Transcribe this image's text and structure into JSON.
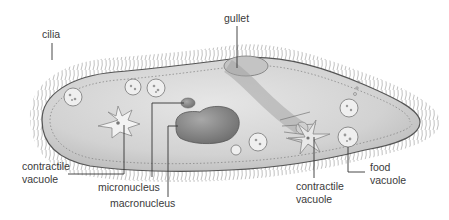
{
  "diagram": {
    "labels": {
      "cilia": "cilia",
      "gullet": "gullet",
      "contractile_vacuole_left_1": "contractile",
      "contractile_vacuole_left_2": "vacuole",
      "micronucleus": "micronucleus",
      "macronucleus": "macronucleus",
      "contractile_vacuole_right_1": "contractile",
      "contractile_vacuole_right_2": "vacuole",
      "food_vacuole_1": "food",
      "food_vacuole_2": "vacuole"
    },
    "colors": {
      "body_fill": "#d9d9d9",
      "body_outline": "#555555",
      "nucleus_fill": "#8a8a8a",
      "cilia": "#9a9a9a",
      "leader_line": "#333333",
      "text": "#3a3a3a"
    }
  }
}
